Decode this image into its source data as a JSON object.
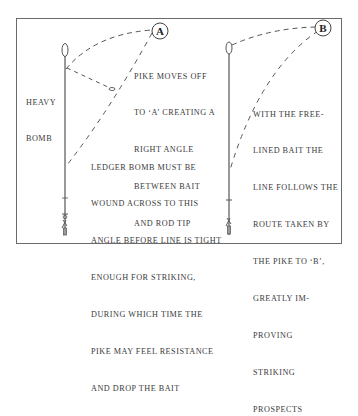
{
  "diagram": {
    "left_panel": {
      "marker": "A",
      "side_label": [
        "HEAVY",
        "BOMB"
      ],
      "caption_top": [
        "PIKE MOVES OFF",
        "TO ‘A’ CREATING A",
        "RIGHT ANGLE",
        "BETWEEN BAIT",
        "AND ROD TIP"
      ],
      "caption_bottom": [
        "LEDGER BOMB MUST BE",
        "WOUND ACROSS TO THIS",
        "ANGLE BEFORE LINE IS TIGHT",
        "ENOUGH FOR STRIKING,",
        "DURING WHICH TIME THE",
        "PIKE MAY FEEL RESISTANCE",
        "AND DROP THE BAIT"
      ]
    },
    "right_panel": {
      "marker": "B",
      "caption": [
        "WITH THE FREE-",
        "LINED BAIT THE",
        "LINE FOLLOWS THE",
        "ROUTE TAKEN BY",
        "THE PIKE TO ‘B’,",
        "GREATLY IM-",
        "PROVING",
        "STRIKING",
        "PROSPECTS"
      ]
    },
    "colors": {
      "ink": "#3a3a3a",
      "frame": "#6a6a6a",
      "background": "#ffffff"
    }
  }
}
